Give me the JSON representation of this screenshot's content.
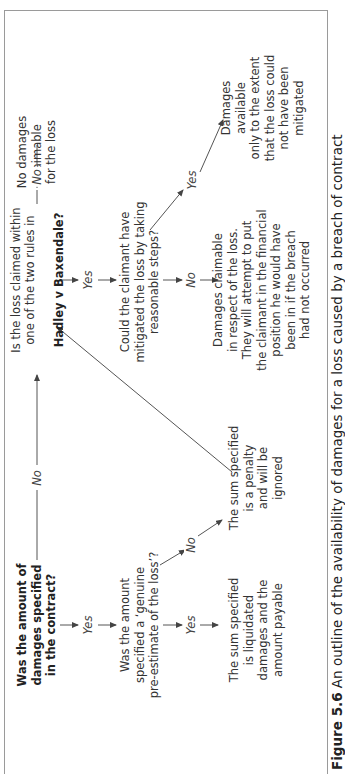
{
  "figure": {
    "caption_number": "Figure 5.6",
    "caption_text": "An outline of the availability of damages for a loss caused by a breach of contract"
  },
  "nodes": {
    "q_amount_specified": "Was the amount of\ndamages specified\nin the contract?",
    "q_genuine_preestimate": "Was the amount\nspecified a ‘genuine\npre-estimate of the loss’?",
    "r_liquidated": "The sum specified\nis liquidated\ndamages and the\namount payable",
    "r_penalty": "The sum specified\nis a penalty\nand will be\nignored",
    "q_hadley_pre": "Is the loss claimed within\none of the two rules in",
    "q_hadley_case": "Hadley v Baxendale?",
    "q_mitigate": "Could the claimant have\nmitigated the loss by taking\nreasonable steps?",
    "r_damages_claimable": "Damages claimable\nin respect of the loss.\nThey will attempt to put\nthe claimant in the financial\nposition he would have\nbeen in if the breach\nhad not occurred",
    "r_no_damages": "No damages\nclaimable\nfor the loss",
    "r_mitigated": "Damages available\nonly to the extent\nthat the loss could\nnot have been\nmitigated"
  },
  "edge_labels": {
    "amount_yes": "Yes",
    "amount_no": "No",
    "preestimate_yes": "Yes",
    "preestimate_no": "No",
    "hadley_yes": "Yes",
    "hadley_no": "No",
    "mitigate_yes": "Yes",
    "mitigate_no": "No"
  },
  "colors": {
    "line": "#444444",
    "frame": "#9a9a9a",
    "text": "#333333"
  }
}
